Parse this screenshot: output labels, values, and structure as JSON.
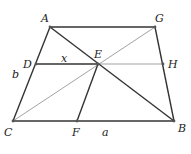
{
  "figure": {
    "caption": "",
    "colors": {
      "stroke_dark": "#333333",
      "stroke_light": "#8a8a8a",
      "label": "#222222",
      "background": "#ffffff"
    },
    "points": {
      "A": {
        "label": "A",
        "x": 50,
        "y": 27
      },
      "G": {
        "label": "G",
        "x": 155,
        "y": 27
      },
      "D": {
        "label": "D",
        "x": 36,
        "y": 64
      },
      "E": {
        "label": "E",
        "x": 98,
        "y": 64
      },
      "H": {
        "label": "H",
        "x": 163,
        "y": 64
      },
      "C": {
        "label": "C",
        "x": 13,
        "y": 121
      },
      "F": {
        "label": "F",
        "x": 77,
        "y": 121
      },
      "B": {
        "label": "B",
        "x": 174,
        "y": 121
      }
    },
    "segment_labels": {
      "x": "x",
      "a": "a",
      "b": "b"
    },
    "edges": [
      {
        "from": "A",
        "to": "G",
        "style": "thick"
      },
      {
        "from": "A",
        "to": "C",
        "style": "thick"
      },
      {
        "from": "G",
        "to": "B",
        "style": "thick"
      },
      {
        "from": "C",
        "to": "B",
        "style": "thick"
      },
      {
        "from": "A",
        "to": "B",
        "style": "thick"
      },
      {
        "from": "D",
        "to": "E",
        "style": "thick"
      },
      {
        "from": "E",
        "to": "F",
        "style": "thick"
      },
      {
        "from": "E",
        "to": "H",
        "style": "thin"
      },
      {
        "from": "C",
        "to": "G",
        "style": "thin"
      }
    ]
  }
}
